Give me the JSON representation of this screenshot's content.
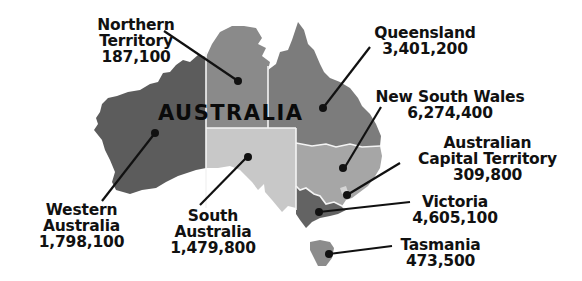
{
  "map": {
    "title": "AUSTRALIA",
    "colors": {
      "western_australia": "#5c5c5c",
      "northern_territory": "#8a8a8a",
      "queensland": "#7c7c7c",
      "south_australia": "#c8c8c8",
      "new_south_wales": "#a6a6a6",
      "act": "#d4d4d4",
      "victoria": "#636363",
      "tasmania": "#8c8c8c",
      "border": "#f4f4f4",
      "text": "#111111"
    },
    "regions": [
      {
        "id": "northern_territory",
        "name_lines": [
          "Northern",
          "Territory"
        ],
        "population": "187,100"
      },
      {
        "id": "queensland",
        "name_lines": [
          "Queensland"
        ],
        "population": "3,401,200"
      },
      {
        "id": "new_south_wales",
        "name_lines": [
          "New South Wales"
        ],
        "population": "6,274,400"
      },
      {
        "id": "act",
        "name_lines": [
          "Australian",
          "Capital Territory"
        ],
        "population": "309,800"
      },
      {
        "id": "victoria",
        "name_lines": [
          "Victoria"
        ],
        "population": "4,605,100"
      },
      {
        "id": "tasmania",
        "name_lines": [
          "Tasmania"
        ],
        "population": "473,500"
      },
      {
        "id": "south_australia",
        "name_lines": [
          "South",
          "Australia"
        ],
        "population": "1,479,800"
      },
      {
        "id": "western_australia",
        "name_lines": [
          "Western",
          "Australia"
        ],
        "population": "1,798,100"
      }
    ]
  }
}
